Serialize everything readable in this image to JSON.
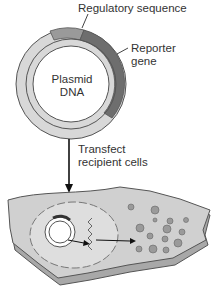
{
  "labels": {
    "regulatory": "Regulatory sequence",
    "reporter_line1": "Reporter",
    "reporter_line2": "gene",
    "plasmid_line1": "Plasmid",
    "plasmid_line2": "DNA",
    "transfect_line1": "Transfect",
    "transfect_line2": "recipient cells"
  },
  "colors": {
    "plasmid_light": "#d0d0d0",
    "regulatory": "#9a9a9a",
    "reporter": "#6e6e6e",
    "cell": "#c8c8c8"
  }
}
